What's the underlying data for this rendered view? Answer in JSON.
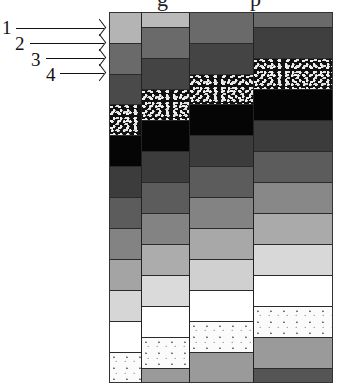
{
  "title_fragment": {
    "left": "g",
    "right": "p"
  },
  "labels": [
    {
      "text": "1",
      "x": 2,
      "y": 18,
      "arrow_from": 16,
      "arrow_to": 104,
      "arrow_y": 28
    },
    {
      "text": "2",
      "x": 15,
      "y": 34,
      "arrow_from": 30,
      "arrow_to": 104,
      "arrow_y": 43
    },
    {
      "text": "3",
      "x": 31,
      "y": 50,
      "arrow_from": 46,
      "arrow_to": 104,
      "arrow_y": 58
    },
    {
      "text": "4",
      "x": 46,
      "y": 65,
      "arrow_from": 60,
      "arrow_to": 104,
      "arrow_y": 73
    }
  ],
  "colors": {
    "c1": "#b4b4b4",
    "c2": "#6a6a6a",
    "c3": "#4a4a4a",
    "black": "#050505",
    "c5": "#3c3c3c",
    "c6": "#5c5c5c",
    "c7": "#838383",
    "c8": "#a4a4a4",
    "c9": "#d6d6d6",
    "white": "#ffffff",
    "c11": "#9a9a9a",
    "c12": "#555555"
  },
  "columns": [
    {
      "name": "column-1",
      "left": 0,
      "width": 32,
      "blocks": [
        {
          "y": 0,
          "h": 31,
          "fill": "#b4b4b4"
        },
        {
          "y": 31,
          "h": 31,
          "fill": "#6a6a6a"
        },
        {
          "y": 62,
          "h": 30,
          "fill": "#4a4a4a"
        },
        {
          "y": 92,
          "h": 31,
          "fill": "speckle"
        },
        {
          "y": 123,
          "h": 31,
          "fill": "#050505"
        },
        {
          "y": 154,
          "h": 31,
          "fill": "#3c3c3c"
        },
        {
          "y": 185,
          "h": 31,
          "fill": "#5c5c5c"
        },
        {
          "y": 216,
          "h": 31,
          "fill": "#838383"
        },
        {
          "y": 247,
          "h": 31,
          "fill": "#a4a4a4"
        },
        {
          "y": 278,
          "h": 31,
          "fill": "#d6d6d6"
        },
        {
          "y": 309,
          "h": 31,
          "fill": "#ffffff"
        },
        {
          "y": 340,
          "h": 31,
          "fill": "dots"
        }
      ]
    },
    {
      "name": "column-2",
      "left": 32,
      "width": 48,
      "blocks": [
        {
          "y": 0,
          "h": 15,
          "fill": "#bababa"
        },
        {
          "y": 15,
          "h": 31,
          "fill": "#6a6a6a"
        },
        {
          "y": 46,
          "h": 31,
          "fill": "#444444"
        },
        {
          "y": 77,
          "h": 31,
          "fill": "speckle"
        },
        {
          "y": 108,
          "h": 31,
          "fill": "#050505"
        },
        {
          "y": 139,
          "h": 31,
          "fill": "#3c3c3c"
        },
        {
          "y": 170,
          "h": 31,
          "fill": "#5c5c5c"
        },
        {
          "y": 201,
          "h": 31,
          "fill": "#838383"
        },
        {
          "y": 232,
          "h": 31,
          "fill": "#acacac"
        },
        {
          "y": 263,
          "h": 31,
          "fill": "#dadada"
        },
        {
          "y": 294,
          "h": 31,
          "fill": "#ffffff"
        },
        {
          "y": 325,
          "h": 31,
          "fill": "dots"
        },
        {
          "y": 356,
          "h": 15,
          "fill": "#9a9a9a"
        }
      ]
    },
    {
      "name": "column-3",
      "left": 80,
      "width": 64,
      "blocks": [
        {
          "y": 0,
          "h": 31,
          "fill": "#6a6a6a"
        },
        {
          "y": 31,
          "h": 31,
          "fill": "#444444"
        },
        {
          "y": 62,
          "h": 30,
          "fill": "speckle"
        },
        {
          "y": 92,
          "h": 31,
          "fill": "#050505"
        },
        {
          "y": 123,
          "h": 31,
          "fill": "#3c3c3c"
        },
        {
          "y": 154,
          "h": 31,
          "fill": "#5c5c5c"
        },
        {
          "y": 185,
          "h": 31,
          "fill": "#838383"
        },
        {
          "y": 216,
          "h": 31,
          "fill": "#a8a8a8"
        },
        {
          "y": 247,
          "h": 31,
          "fill": "#d0d0d0"
        },
        {
          "y": 278,
          "h": 31,
          "fill": "#ffffff"
        },
        {
          "y": 309,
          "h": 31,
          "fill": "dots"
        },
        {
          "y": 340,
          "h": 31,
          "fill": "#9a9a9a"
        }
      ]
    },
    {
      "name": "column-4",
      "left": 144,
      "width": 80,
      "blocks": [
        {
          "y": 0,
          "h": 15,
          "fill": "#6a6a6a"
        },
        {
          "y": 15,
          "h": 31,
          "fill": "#3f3f3f"
        },
        {
          "y": 46,
          "h": 31,
          "fill": "speckle"
        },
        {
          "y": 77,
          "h": 31,
          "fill": "#050505"
        },
        {
          "y": 108,
          "h": 31,
          "fill": "#3c3c3c"
        },
        {
          "y": 139,
          "h": 31,
          "fill": "#5c5c5c"
        },
        {
          "y": 170,
          "h": 31,
          "fill": "#888888"
        },
        {
          "y": 201,
          "h": 31,
          "fill": "#aaaaaa"
        },
        {
          "y": 232,
          "h": 31,
          "fill": "#d8d8d8"
        },
        {
          "y": 263,
          "h": 31,
          "fill": "#ffffff"
        },
        {
          "y": 294,
          "h": 31,
          "fill": "dots"
        },
        {
          "y": 325,
          "h": 31,
          "fill": "#9a9a9a"
        },
        {
          "y": 356,
          "h": 15,
          "fill": "#555555"
        }
      ]
    }
  ]
}
